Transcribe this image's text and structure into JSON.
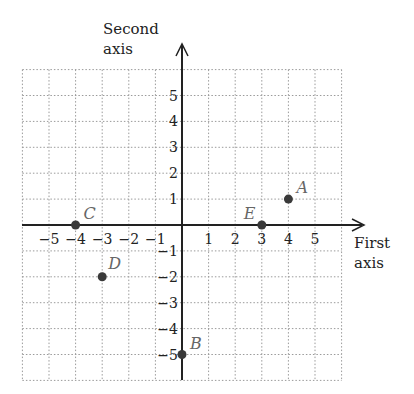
{
  "axes": {
    "x_label_line1": "First",
    "x_label_line2": "axis",
    "y_label_line1": "Second",
    "y_label_line2": "axis",
    "x_ticks": [
      "−5",
      "−4",
      "−3",
      "−2",
      "−1",
      "1",
      "2",
      "3",
      "4",
      "5"
    ],
    "y_ticks": [
      "5",
      "4",
      "3",
      "2",
      "1",
      "−1",
      "−2",
      "−3",
      "−4",
      "−5"
    ],
    "range": {
      "x": [
        -6,
        6
      ],
      "y": [
        -6,
        6
      ]
    }
  },
  "points": [
    {
      "name": "A",
      "x": 4,
      "y": 1
    },
    {
      "name": "B",
      "x": 0,
      "y": -5
    },
    {
      "name": "C",
      "x": -4,
      "y": 0
    },
    {
      "name": "D",
      "x": -3,
      "y": -2
    },
    {
      "name": "E",
      "x": 3,
      "y": 0
    }
  ],
  "colors": {
    "axis": "#222222",
    "grid": "#9a9a9a",
    "point": "#3a3a3a",
    "point_label": "#666666"
  }
}
